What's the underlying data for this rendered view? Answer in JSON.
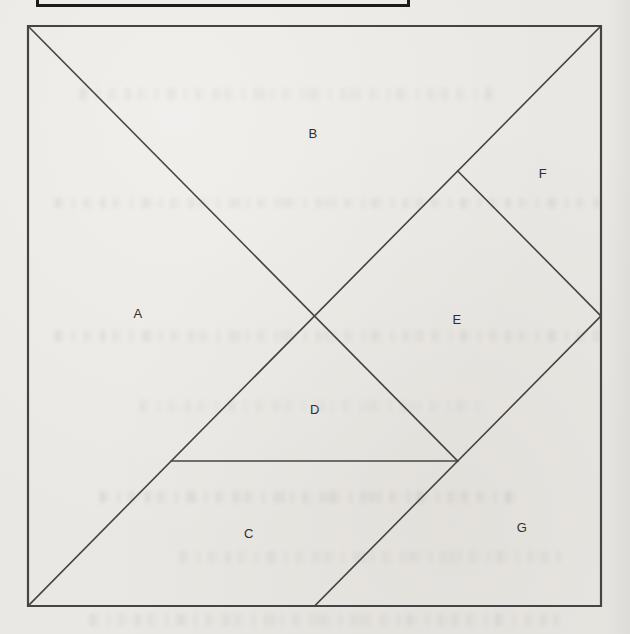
{
  "figure": {
    "type": "tangram-dissection-diagram",
    "background_color": "#eae8e4",
    "line_color": "#454545",
    "label_color": "#2e2e2e",
    "pieces": [
      {
        "label": "A",
        "shape": "large right triangle, left side"
      },
      {
        "label": "B",
        "shape": "large right triangle, top side"
      },
      {
        "label": "C",
        "shape": "parallelogram, bottom left"
      },
      {
        "label": "D",
        "shape": "small right triangle, center"
      },
      {
        "label": "E",
        "shape": "square, rotated 45 degrees, right of center"
      },
      {
        "label": "F",
        "shape": "small right triangle, upper right"
      },
      {
        "label": "G",
        "shape": "medium right triangle, bottom right"
      }
    ],
    "labels": [
      {
        "text": "A",
        "x": 138,
        "y": 313
      },
      {
        "text": "B",
        "x": 313,
        "y": 133
      },
      {
        "text": "C",
        "x": 249,
        "y": 533
      },
      {
        "text": "D",
        "x": 315,
        "y": 409
      },
      {
        "text": "E",
        "x": 457,
        "y": 319
      },
      {
        "text": "F",
        "x": 543,
        "y": 173
      },
      {
        "text": "G",
        "x": 522,
        "y": 527
      }
    ],
    "segments": [
      {
        "name": "square-border",
        "width": 2.2,
        "points": [
          [
            28,
            26
          ],
          [
            601,
            26
          ],
          [
            601,
            606
          ],
          [
            28,
            606
          ],
          [
            28,
            26
          ]
        ]
      },
      {
        "name": "diagonal-topleft-to-threequarter-point",
        "width": 1.6,
        "points": [
          [
            28,
            26
          ],
          [
            457.75,
            461
          ]
        ]
      },
      {
        "name": "antidiagonal-topright-to-bottomleft",
        "width": 1.6,
        "points": [
          [
            601,
            26
          ],
          [
            28,
            606
          ]
        ]
      },
      {
        "name": "horizontal-cut",
        "width": 1.6,
        "points": [
          [
            171.25,
            461
          ],
          [
            457.75,
            461
          ]
        ]
      },
      {
        "name": "cut-antidiagonal-to-right-midpoint",
        "width": 1.6,
        "points": [
          [
            457.75,
            171
          ],
          [
            601,
            316
          ]
        ]
      },
      {
        "name": "cut-bottom-midpoint-to-right-midpoint",
        "width": 1.6,
        "points": [
          [
            314.5,
            606
          ],
          [
            601,
            316
          ]
        ]
      }
    ]
  },
  "cropped_box_top": {
    "present": true,
    "note": ""
  }
}
